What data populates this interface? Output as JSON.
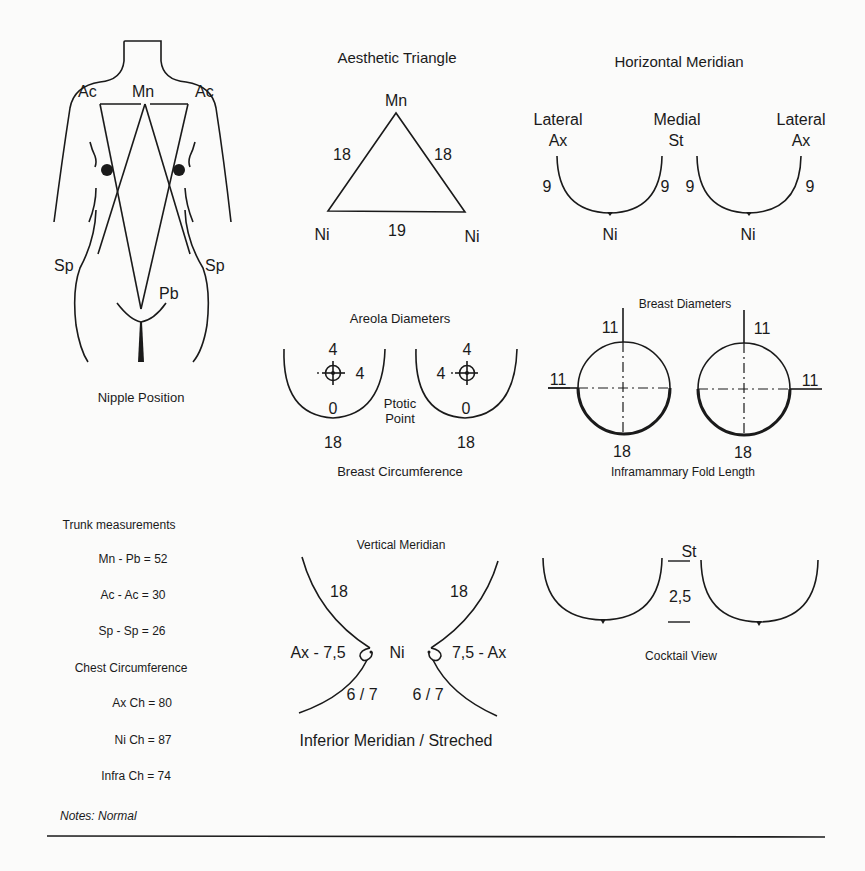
{
  "nipple_position": {
    "title": "Nipple Position",
    "labels": {
      "ac_left": "Ac",
      "mn": "Mn",
      "ac_right": "Ac",
      "sp_left": "Sp",
      "sp_right": "Sp",
      "pb": "Pb"
    }
  },
  "aesthetic_triangle": {
    "title": "Aesthetic Triangle",
    "apex": "Mn",
    "left_vertex": "Ni",
    "right_vertex": "Ni",
    "left_side": "18",
    "right_side": "18",
    "base": "19"
  },
  "horizontal_meridian": {
    "title": "Horizontal Meridian",
    "left_outer_label_1": "Lateral",
    "left_outer_label_2": "Ax",
    "middle_label_1": "Medial",
    "middle_label_2": "St",
    "right_outer_label_1": "Lateral",
    "right_outer_label_2": "Ax",
    "left_breast": {
      "lateral": "9",
      "medial": "9",
      "nipple": "Ni"
    },
    "right_breast": {
      "medial": "9",
      "lateral": "9",
      "nipple": "Ni"
    }
  },
  "areola": {
    "title": "Areola Diameters",
    "left": {
      "vertical": "4",
      "horizontal": "4",
      "ptosis": "0",
      "circumference": "18"
    },
    "right": {
      "vertical": "4",
      "horizontal": "4",
      "ptosis": "0",
      "circumference": "18"
    },
    "ptotic_label_1": "Ptotic",
    "ptotic_label_2": "Point",
    "footer": "Breast Circumference"
  },
  "breast_diameters": {
    "title": "Breast Diameters",
    "left": {
      "vertical": "11",
      "horizontal": "11",
      "fold": "18"
    },
    "right": {
      "vertical": "11",
      "horizontal": "11",
      "fold": "18"
    },
    "footer": "Inframammary Fold Length"
  },
  "trunk": {
    "title": "Trunk measurements",
    "items": [
      {
        "label": "Mn - Pb = 52"
      },
      {
        "label": "Ac - Ac = 30"
      },
      {
        "label": "Sp - Sp = 26"
      }
    ],
    "chest_title": "Chest Circumference",
    "chest_items": [
      {
        "label": "Ax Ch = 80"
      },
      {
        "label": "Ni Ch = 87"
      },
      {
        "label": "Infra Ch = 74"
      }
    ]
  },
  "vertical_meridian": {
    "title": "Vertical Meridian",
    "left_upper": "18",
    "right_upper": "18",
    "left_side": "Ax - 7,5",
    "center": "Ni",
    "right_side": "7,5 - Ax",
    "left_lower": "6 / 7",
    "right_lower": "6 / 7",
    "footer": "Inferior Meridian / Streched"
  },
  "cocktail_view": {
    "top_label": "St",
    "distance": "2,5",
    "footer": "Cocktail View"
  },
  "notes": {
    "text": "Notes: Normal"
  }
}
